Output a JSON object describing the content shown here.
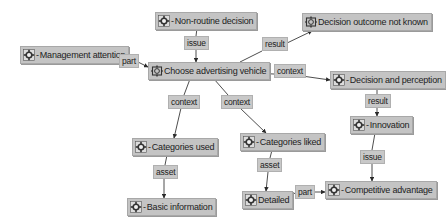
{
  "diagram": {
    "nodes": [
      {
        "id": "non-routine-decision",
        "label": "Non-routine decision",
        "prefix": "-",
        "icon": "gear-flower-icon",
        "x": 155,
        "y": 12,
        "w": 86
      },
      {
        "id": "decision-outcome-not-known",
        "label": "Decision outcome not known",
        "prefix": "",
        "icon": "gear-box-icon",
        "x": 302,
        "y": 13,
        "w": 110
      },
      {
        "id": "management-attention",
        "label": "Management attention",
        "prefix": "-",
        "icon": "gear-flower-icon",
        "x": 20,
        "y": 46,
        "w": 92
      },
      {
        "id": "choose-advertising-vehicle",
        "label": "Choose advertising vehicle",
        "prefix": "",
        "icon": "gear-box-icon",
        "x": 148,
        "y": 62,
        "w": 100
      },
      {
        "id": "decision-and-perception",
        "label": "Decision and perception",
        "prefix": "-",
        "icon": "gear-flower-icon",
        "x": 330,
        "y": 71,
        "w": 98
      },
      {
        "id": "innovation",
        "label": "Innovation",
        "prefix": "-",
        "icon": "gear-flower-icon",
        "x": 350,
        "y": 116,
        "w": 54
      },
      {
        "id": "categories-liked",
        "label": "Categories liked",
        "prefix": "-",
        "icon": "gear-flower-icon",
        "x": 240,
        "y": 133,
        "w": 73
      },
      {
        "id": "categories-used",
        "label": "Categories used",
        "prefix": "-",
        "icon": "gear-flower-icon",
        "x": 132,
        "y": 138,
        "w": 74
      },
      {
        "id": "competitive-advantage",
        "label": "Competitive advantage",
        "prefix": "-",
        "icon": "gear-flower-icon",
        "x": 325,
        "y": 181,
        "w": 92
      },
      {
        "id": "detailed",
        "label": "Detailed",
        "prefix": "",
        "icon": "gear-flower-icon",
        "x": 242,
        "y": 191,
        "w": 44
      },
      {
        "id": "basic-information",
        "label": "Basic information",
        "prefix": "-",
        "icon": "gear-flower-icon",
        "x": 127,
        "y": 198,
        "w": 76
      }
    ],
    "edge_labels": [
      {
        "id": "part-1",
        "label": "part",
        "x": 119,
        "y": 54,
        "w": 17
      },
      {
        "id": "issue-1",
        "label": "issue",
        "x": 184,
        "y": 36,
        "w": 20
      },
      {
        "id": "result-1",
        "label": "result",
        "x": 262,
        "y": 37,
        "w": 23
      },
      {
        "id": "context-right",
        "label": "context",
        "x": 274,
        "y": 64,
        "w": 28
      },
      {
        "id": "context-left",
        "label": "context",
        "x": 168,
        "y": 95,
        "w": 28
      },
      {
        "id": "context-mid",
        "label": "context",
        "x": 221,
        "y": 95,
        "w": 28
      },
      {
        "id": "result-2",
        "label": "result",
        "x": 365,
        "y": 94,
        "w": 22
      },
      {
        "id": "issue-2",
        "label": "issue",
        "x": 360,
        "y": 150,
        "w": 21
      },
      {
        "id": "asset-1",
        "label": "asset",
        "x": 153,
        "y": 165,
        "w": 21
      },
      {
        "id": "asset-2",
        "label": "asset",
        "x": 257,
        "y": 158,
        "w": 21
      },
      {
        "id": "part-2",
        "label": "part",
        "x": 295,
        "y": 185,
        "w": 18
      }
    ],
    "edges": [
      {
        "from": "management-attention",
        "via": "part-1",
        "to": "choose-advertising-vehicle",
        "points": [
          [
            112,
            62
          ],
          [
            119,
            61
          ]
        ],
        "points2": [
          [
            136,
            61
          ],
          [
            148,
            67
          ]
        ]
      },
      {
        "from": "non-routine-decision",
        "via": "issue-1",
        "to": "choose-advertising-vehicle",
        "points": [
          [
            197,
            28
          ],
          [
            196,
            36
          ]
        ],
        "points2": [
          [
            196,
            49
          ],
          [
            196,
            62
          ]
        ]
      },
      {
        "from": "choose-advertising-vehicle",
        "via": "result-1",
        "to": "decision-outcome-not-known",
        "points": [
          [
            240,
            62
          ],
          [
            262,
            51
          ]
        ],
        "points2": [
          [
            285,
            44
          ],
          [
            312,
            31
          ]
        ]
      },
      {
        "from": "choose-advertising-vehicle",
        "via": "context-right",
        "to": "decision-and-perception",
        "points": [
          [
            248,
            73
          ],
          [
            274,
            74
          ]
        ],
        "points2": [
          [
            302,
            76
          ],
          [
            330,
            80
          ]
        ]
      },
      {
        "from": "choose-advertising-vehicle",
        "via": "context-left",
        "to": "categories-used",
        "points": [
          [
            190,
            79
          ],
          [
            184,
            95
          ]
        ],
        "points2": [
          [
            181,
            108
          ],
          [
            174,
            138
          ]
        ]
      },
      {
        "from": "choose-advertising-vehicle",
        "via": "context-mid",
        "to": "categories-liked",
        "points": [
          [
            214,
            79
          ],
          [
            228,
            95
          ]
        ],
        "points2": [
          [
            240,
            108
          ],
          [
            266,
            133
          ]
        ]
      },
      {
        "from": "decision-and-perception",
        "via": "result-2",
        "to": "innovation",
        "points": [
          [
            377,
            89
          ],
          [
            377,
            94
          ]
        ],
        "points2": [
          [
            377,
            107
          ],
          [
            377,
            116
          ]
        ]
      },
      {
        "from": "innovation",
        "via": "issue-2",
        "to": "competitive-advantage",
        "points": [
          [
            375,
            133
          ],
          [
            372,
            150
          ]
        ],
        "points2": [
          [
            372,
            162
          ],
          [
            372,
            181
          ]
        ]
      },
      {
        "from": "categories-used",
        "via": "asset-1",
        "to": "basic-information",
        "points": [
          [
            167,
            155
          ],
          [
            165,
            165
          ]
        ],
        "points2": [
          [
            164,
            179
          ],
          [
            164,
            198
          ]
        ]
      },
      {
        "from": "categories-liked",
        "via": "asset-2",
        "to": "detailed",
        "points": [
          [
            272,
            150
          ],
          [
            270,
            158
          ]
        ],
        "points2": [
          [
            268,
            172
          ],
          [
            266,
            191
          ]
        ]
      },
      {
        "from": "detailed",
        "via": "part-2",
        "to": "competitive-advantage",
        "points": [
          [
            286,
            200
          ],
          [
            295,
            193
          ]
        ],
        "points2": [
          [
            313,
            192
          ],
          [
            325,
            192
          ]
        ]
      }
    ],
    "colors": {
      "node_bg": "#c4c4c4",
      "label_bg": "#c8c8c8",
      "line": "#3a3a3a",
      "background": "#ffffff"
    }
  }
}
